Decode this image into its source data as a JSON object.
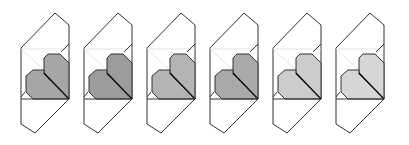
{
  "diagram": {
    "step_count": 6,
    "spacing_px": 63,
    "first_offset_x": 0,
    "line_color": "#333333",
    "faint_line_color": "#dcdcdc",
    "paper_color": "#ffffff",
    "steps": [
      {
        "index": 1,
        "fill": "#a6a6a6"
      },
      {
        "index": 2,
        "fill": "#9c9c9c"
      },
      {
        "index": 3,
        "fill": "#b4b4b4"
      },
      {
        "index": 4,
        "fill": "#a9a9a9"
      },
      {
        "index": 5,
        "fill": "#cccccc"
      },
      {
        "index": 6,
        "fill": "#d6d6d6"
      }
    ]
  }
}
